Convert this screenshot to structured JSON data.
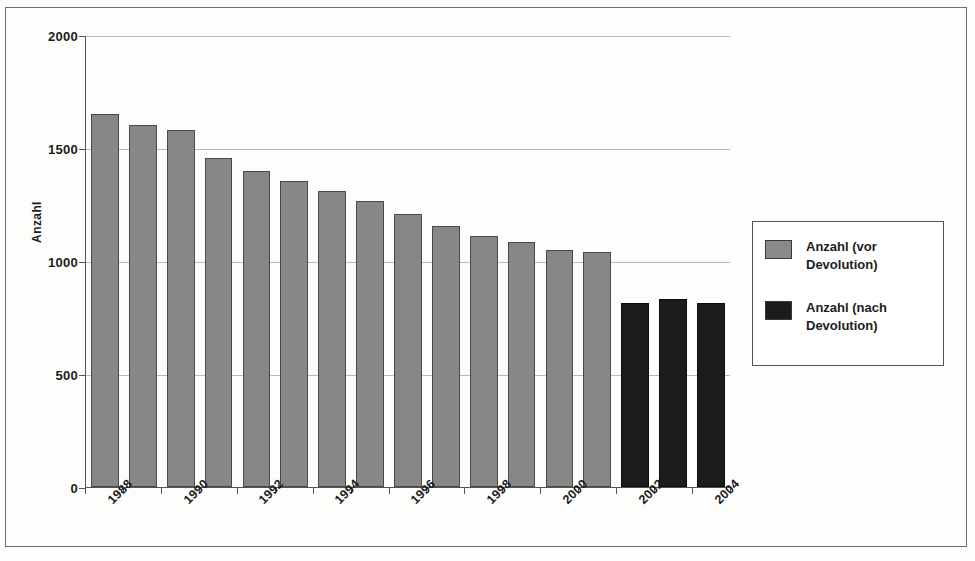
{
  "chart_data": {
    "type": "bar",
    "title": "",
    "xlabel": "",
    "ylabel": "Anzahl",
    "ylim": [
      0,
      2000
    ],
    "yticks": [
      0,
      500,
      1000,
      1500,
      2000
    ],
    "ytick_labels": [
      "0",
      "500",
      "1000",
      "1500",
      "2000"
    ],
    "grid": true,
    "legend_position": "right",
    "categories": [
      "1988",
      "1989",
      "1990",
      "1991",
      "1992",
      "1993",
      "1994",
      "1995",
      "1996",
      "1997",
      "1998",
      "1999",
      "2000",
      "2001",
      "2002",
      "2003",
      "2004"
    ],
    "visible_tick_labels": [
      "1988",
      "1990",
      "1992",
      "1994",
      "1996",
      "1998",
      "2000",
      "2002",
      "2004"
    ],
    "series": [
      {
        "name": "Anzahl (vor Devolution)",
        "color": "#878787",
        "values": [
          1650,
          1600,
          1580,
          1455,
          1400,
          1355,
          1310,
          1265,
          1210,
          1155,
          1110,
          1085,
          1050,
          1040,
          null,
          null,
          null
        ]
      },
      {
        "name": "Anzahl (nach Devolution)",
        "color": "#1c1c1c",
        "values": [
          null,
          null,
          null,
          null,
          null,
          null,
          null,
          null,
          null,
          null,
          null,
          null,
          null,
          null,
          815,
          830,
          815
        ]
      }
    ]
  },
  "legend": {
    "entries": [
      {
        "label": "Anzahl (vor Devolution)",
        "swatch": "gray-swatch"
      },
      {
        "label": "Anzahl (nach Devolution)",
        "swatch": "black-swatch"
      }
    ]
  },
  "axes": {
    "y_title": "Anzahl"
  }
}
